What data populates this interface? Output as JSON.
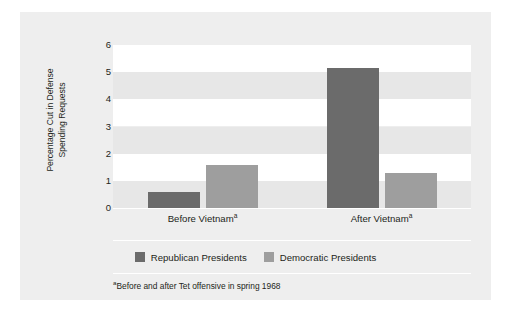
{
  "chart_data": {
    "type": "bar",
    "title": "",
    "xlabel": "",
    "ylabel": "Percentage Cut in Defense Spending Requests",
    "ylabel_lines": [
      "Percentage Cut in Defense",
      "Spending Requests"
    ],
    "categories": [
      "Before Vietnam",
      "After Vietnam"
    ],
    "category_labels": [
      {
        "text": "Before Vietnam",
        "superscript": "a"
      },
      {
        "text": "After Vietnam",
        "superscript": "a"
      }
    ],
    "series": [
      {
        "name": "Republican Presidents",
        "color": "#6b6b6b",
        "values": [
          0.6,
          5.15
        ]
      },
      {
        "name": "Democratic Presidents",
        "color": "#9e9e9e",
        "values": [
          1.6,
          1.3
        ]
      }
    ],
    "ylim": [
      0,
      6
    ],
    "ytick_values": [
      0,
      1,
      2,
      3,
      4,
      5,
      6
    ],
    "ytick_labels": [
      "0",
      "1",
      "2",
      "3",
      "4",
      "5",
      "6"
    ],
    "grid": "alternating-horizontal-bands",
    "legend_position": "bottom-center",
    "annotations": [
      {
        "marker": "a",
        "text": "Before and after Tet offensive in spring 1968"
      }
    ]
  },
  "footnote": {
    "marker": "a",
    "text": "Before and after Tet offensive in spring 1968"
  },
  "colors": {
    "panel_background": "#eeeeee",
    "band_light": "#ffffff",
    "band_shade": "#e7e7e7",
    "republican": "#6b6b6b",
    "democratic": "#9e9e9e",
    "text": "#231f20"
  }
}
